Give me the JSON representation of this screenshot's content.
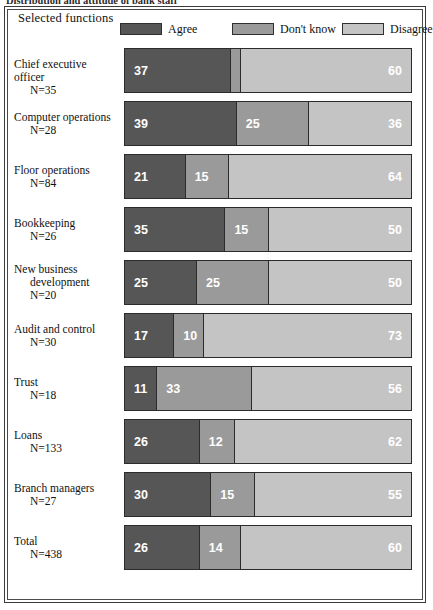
{
  "caption": "Distribution and attitude of bank staff",
  "panel": {
    "title": "Selected functions"
  },
  "legend": {
    "items": [
      {
        "label": "Agree",
        "color": "#565656",
        "name": "legend-agree"
      },
      {
        "label": "Don't know",
        "color": "#9a9a9a",
        "name": "legend-dont-know"
      },
      {
        "label": "Disagree",
        "color": "#c4c4c4",
        "name": "legend-disagree"
      }
    ]
  },
  "chart_data": {
    "type": "bar",
    "title": "Selected functions",
    "subtype": "100% stacked horizontal bar",
    "xlabel": "",
    "ylabel": "",
    "xlim": [
      0,
      100
    ],
    "grid": false,
    "legend_position": "top",
    "categories": [
      "Chief executive officer",
      "Computer operations",
      "Floor operations",
      "Bookkeeping",
      "New business development",
      "Audit and control",
      "Trust",
      "Loans",
      "Branch managers",
      "Total"
    ],
    "series": [
      {
        "name": "Agree",
        "color": "#565656",
        "values": [
          37,
          39,
          21,
          35,
          25,
          17,
          11,
          26,
          30,
          26
        ]
      },
      {
        "name": "Don't know",
        "color": "#9a9a9a",
        "values": [
          3,
          25,
          15,
          15,
          25,
          10,
          33,
          12,
          15,
          14
        ]
      },
      {
        "name": "Disagree",
        "color": "#c4c4c4",
        "values": [
          60,
          36,
          64,
          50,
          50,
          73,
          56,
          62,
          55,
          60
        ]
      }
    ],
    "counts": [
      35,
      28,
      84,
      26,
      20,
      30,
      18,
      133,
      27,
      438
    ]
  },
  "rows": [
    {
      "label_lines": [
        "Chief executive officer"
      ],
      "n_label": "N=35",
      "name": "row-chief-executive-officer",
      "values": [
        37,
        3,
        60
      ]
    },
    {
      "label_lines": [
        "Computer operations"
      ],
      "n_label": "N=28",
      "name": "row-computer-operations",
      "values": [
        39,
        25,
        36
      ]
    },
    {
      "label_lines": [
        "Floor operations"
      ],
      "n_label": "N=84",
      "name": "row-floor-operations",
      "values": [
        21,
        15,
        64
      ]
    },
    {
      "label_lines": [
        "Bookkeeping"
      ],
      "n_label": "N=26",
      "name": "row-bookkeeping",
      "values": [
        35,
        15,
        50
      ]
    },
    {
      "label_lines": [
        "New business",
        "development"
      ],
      "n_label": "N=20",
      "name": "row-new-business-development",
      "values": [
        25,
        25,
        50
      ]
    },
    {
      "label_lines": [
        "Audit and control"
      ],
      "n_label": "N=30",
      "name": "row-audit-and-control",
      "values": [
        17,
        10,
        73
      ]
    },
    {
      "label_lines": [
        "Trust"
      ],
      "n_label": "N=18",
      "name": "row-trust",
      "values": [
        11,
        33,
        56
      ]
    },
    {
      "label_lines": [
        "Loans"
      ],
      "n_label": "N=133",
      "name": "row-loans",
      "values": [
        26,
        12,
        62
      ]
    },
    {
      "label_lines": [
        "Branch managers"
      ],
      "n_label": "N=27",
      "name": "row-branch-managers",
      "values": [
        30,
        15,
        55
      ]
    },
    {
      "label_lines": [
        "Total"
      ],
      "n_label": "N=438",
      "name": "row-total",
      "values": [
        26,
        14,
        60
      ]
    }
  ],
  "layout": {
    "row_top_start": 48,
    "row_pitch": 53,
    "bar_height": 45
  }
}
